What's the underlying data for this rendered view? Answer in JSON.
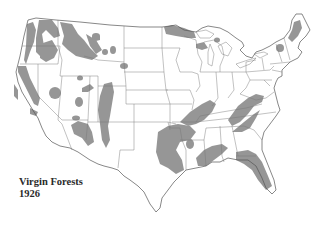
{
  "map": {
    "title_line1": "Virgin Forests",
    "title_line2": "1926",
    "subject": "Contiguous United States",
    "legend_color_forest": "#969696",
    "land_color": "#ffffff",
    "border_color": "#777777"
  }
}
